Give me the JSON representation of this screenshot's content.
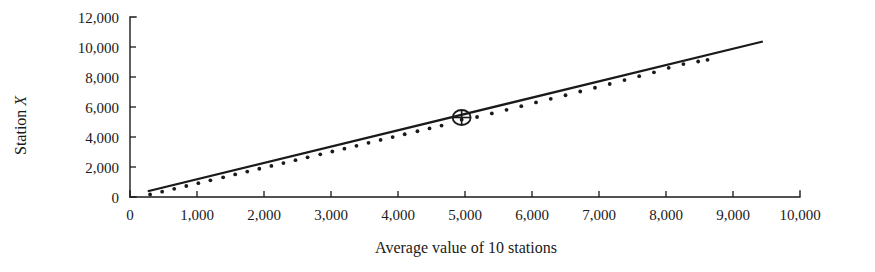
{
  "chart_data": {
    "type": "scatter",
    "title": "",
    "xlabel": "Average value of 10 stations",
    "ylabel": "Station X",
    "xlim": [
      0,
      10000
    ],
    "ylim": [
      0,
      12000
    ],
    "grid": false,
    "legend": null,
    "x_ticks": [
      0,
      1000,
      2000,
      3000,
      4000,
      5000,
      6000,
      7000,
      8000,
      9000,
      10000
    ],
    "x_tick_labels": [
      "0",
      "1,000",
      "2,000",
      "3,000",
      "4,000",
      "5,000",
      "6,000",
      "7,000",
      "8,000",
      "9,000",
      "10,000"
    ],
    "y_ticks": [
      0,
      2000,
      4000,
      6000,
      8000,
      10000,
      12000
    ],
    "y_tick_labels": [
      "0",
      "2,000",
      "4,000",
      "6,000",
      "8,000",
      "10,000",
      "12,000"
    ],
    "x": [
      300,
      480,
      660,
      840,
      1020,
      1200,
      1390,
      1570,
      1750,
      1930,
      2110,
      2290,
      2470,
      2650,
      2840,
      3020,
      3200,
      3380,
      3560,
      3740,
      3920,
      4100,
      4290,
      4470,
      4650,
      4950,
      5180,
      5400,
      5620,
      5840,
      6060,
      6280,
      6500,
      6720,
      6940,
      7160,
      7380,
      7600,
      7820,
      8040,
      8260,
      8480,
      8620
    ],
    "y": [
      320,
      500,
      690,
      880,
      1070,
      1260,
      1460,
      1650,
      1840,
      2030,
      2220,
      2410,
      2600,
      2790,
      2990,
      3180,
      3370,
      3560,
      3760,
      3950,
      4140,
      4330,
      4530,
      4720,
      4910,
      5300,
      5480,
      5720,
      5960,
      6200,
      6450,
      6690,
      6930,
      7180,
      7430,
      7680,
      7940,
      8200,
      8460,
      8760,
      9010,
      9180,
      9290
    ],
    "series": [
      {
        "name": "Observations",
        "marker": "dot",
        "color": "#1a1a1a"
      }
    ],
    "fit_line": {
      "name": "Fitted line",
      "x_start": 280,
      "y_start": 400,
      "x_end": 9430,
      "y_end": 10350,
      "color": "#1a1a1a"
    },
    "highlight": {
      "label": "circled-point",
      "x": 4950,
      "y": 5300,
      "marker": "circle-with-cross"
    }
  },
  "axes": {
    "y_label": "Station ",
    "y_label_italic": "X",
    "x_label": "Average value of 10 stations"
  }
}
